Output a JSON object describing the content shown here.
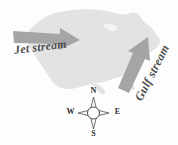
{
  "figure": {
    "background_color": "#fdfdfd",
    "map": {
      "region_name": "contiguous united states",
      "fill_color": "#e3e3e3"
    },
    "arrows": [
      {
        "id": "jet-stream-arrow",
        "label": "Jet stream",
        "direction": "east",
        "fill_color": "#a5a5a5"
      },
      {
        "id": "gulf-stream-arrow",
        "label": "Gulf stream",
        "direction": "northeast",
        "fill_color": "#a5a5a5"
      }
    ],
    "labels": {
      "jet_stream": "Jet stream",
      "gulf_stream": "Gulf stream"
    },
    "compass": {
      "name": "compass rose",
      "north": "N",
      "east": "E",
      "south": "S",
      "west": "W",
      "outline_color": "#3a3a3a",
      "center_fill": "#ffffff"
    }
  }
}
